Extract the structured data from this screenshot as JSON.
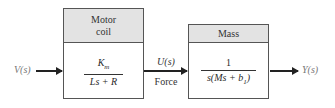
{
  "input_signal": {
    "label": "V(s)"
  },
  "motor_block": {
    "header_line1": "Motor",
    "header_line2": "coil",
    "tf_numerator": "K",
    "tf_numerator_sub": "m",
    "tf_denominator": "Ls + R"
  },
  "intermediate_signal": {
    "label": "U(s)",
    "description": "Force"
  },
  "mass_block": {
    "header": "Mass",
    "tf_numerator": "1",
    "tf_denominator_pre": "s(Ms + b",
    "tf_denominator_sub": "1",
    "tf_denominator_post": ")"
  },
  "output_signal": {
    "label": "Y(s)"
  },
  "colors": {
    "header_fill": "#e3e3e3",
    "border": "#555555",
    "arrow": "#222222",
    "signal_text": "#777777"
  }
}
